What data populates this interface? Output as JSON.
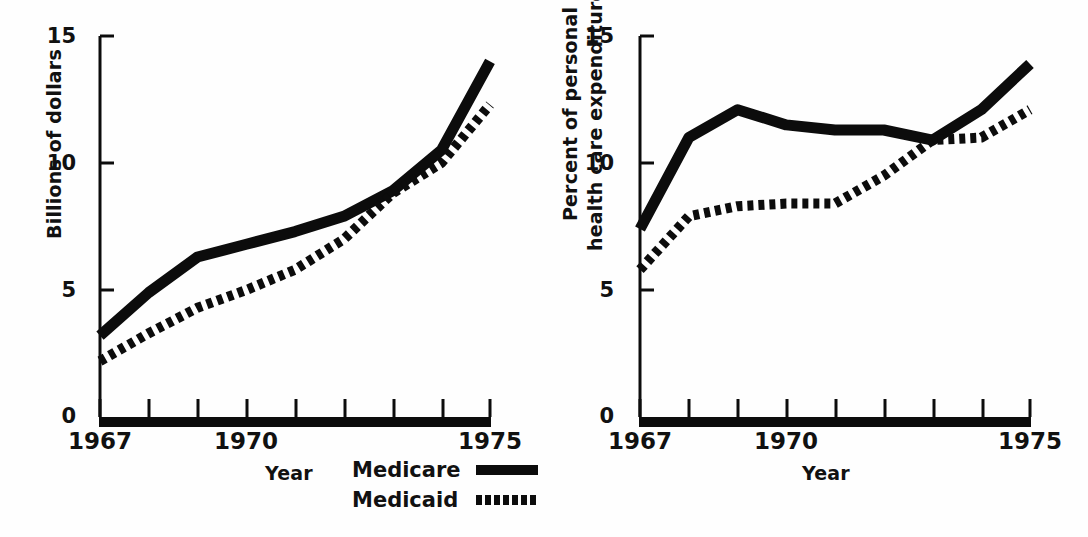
{
  "figure": {
    "background_color": "#ffffff",
    "ink_color": "#0c0c0c"
  },
  "legend": {
    "medicare_label": "Medicare",
    "medicaid_label": "Medicaid",
    "medicare_style": "solid",
    "medicaid_style": "dotted"
  },
  "chart_data": [
    {
      "type": "line",
      "panel": "left",
      "title": "",
      "xlabel": "Year",
      "ylabel": "Billions of dollars",
      "ylabel_lines": [
        "Billions of dollars"
      ],
      "x": [
        1967,
        1968,
        1969,
        1970,
        1971,
        1972,
        1973,
        1974,
        1975
      ],
      "xlim": [
        1967,
        1975
      ],
      "ylim": [
        0,
        15
      ],
      "yticks": [
        0,
        5,
        10,
        15
      ],
      "ytick_labels": [
        "0",
        "5",
        "10",
        "15"
      ],
      "xticks": [
        1967,
        1968,
        1969,
        1970,
        1971,
        1972,
        1973,
        1974,
        1975
      ],
      "xtick_labels_shown": [
        "1967",
        "1970",
        "1975"
      ],
      "xtick_labels_shown_at": [
        1967,
        1970,
        1975
      ],
      "grid": false,
      "legend_position": "below-right",
      "series": [
        {
          "name": "Medicare",
          "style": "solid",
          "values": [
            3.2,
            4.9,
            6.3,
            6.8,
            7.3,
            7.9,
            8.9,
            10.5,
            14.0
          ]
        },
        {
          "name": "Medicaid",
          "style": "dotted",
          "values": [
            2.2,
            3.3,
            4.3,
            5.0,
            5.8,
            7.0,
            8.8,
            10.0,
            12.3
          ]
        }
      ]
    },
    {
      "type": "line",
      "panel": "right",
      "title": "",
      "xlabel": "Year",
      "ylabel": "Percent of personal health care expenditures",
      "ylabel_lines": [
        "Percent of personal",
        "health care expenditures"
      ],
      "x": [
        1967,
        1968,
        1969,
        1970,
        1971,
        1972,
        1973,
        1974,
        1975
      ],
      "xlim": [
        1967,
        1975
      ],
      "ylim": [
        0,
        15
      ],
      "yticks": [
        0,
        5,
        10,
        15
      ],
      "ytick_labels": [
        "0",
        "5",
        "10",
        "15"
      ],
      "xticks": [
        1967,
        1968,
        1969,
        1970,
        1971,
        1972,
        1973,
        1974,
        1975
      ],
      "xtick_labels_shown": [
        "1967",
        "1970",
        "1975"
      ],
      "xtick_labels_shown_at": [
        1967,
        1970,
        1975
      ],
      "grid": false,
      "legend_position": "none",
      "series": [
        {
          "name": "Medicare",
          "style": "solid",
          "values": [
            7.4,
            11.0,
            12.1,
            11.5,
            11.3,
            11.3,
            10.9,
            12.1,
            13.9
          ]
        },
        {
          "name": "Medicaid",
          "style": "dotted",
          "values": [
            5.8,
            7.9,
            8.3,
            8.4,
            8.4,
            9.5,
            10.9,
            11.0,
            12.1
          ]
        }
      ]
    }
  ]
}
